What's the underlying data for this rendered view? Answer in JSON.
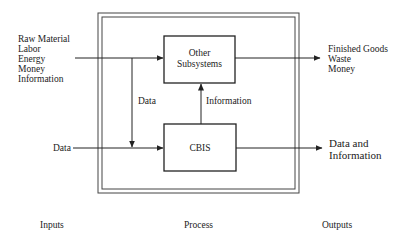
{
  "diagram": {
    "inputs": {
      "resource_list": [
        "Raw Material",
        "Labor",
        "Energy",
        "Money",
        "Information"
      ],
      "data_label": "Data"
    },
    "process": {
      "other_subsystems": [
        "Other",
        "Subsystems"
      ],
      "cbis": "CBIS",
      "data_flow_label": "Data",
      "information_flow_label": "Information"
    },
    "outputs": {
      "physical_list": [
        "Finished Goods",
        "Waste",
        "Money"
      ],
      "info_list": [
        "Data and",
        "Information"
      ]
    },
    "footer": {
      "inputs": "Inputs",
      "process": "Process",
      "outputs": "Outputs"
    }
  }
}
